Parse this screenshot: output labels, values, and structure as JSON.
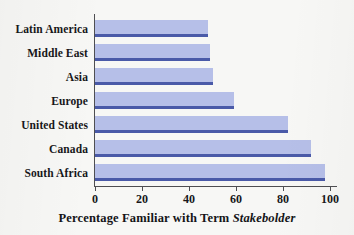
{
  "chart_data": {
    "type": "bar",
    "orientation": "horizontal",
    "title": "",
    "xlabel": "Percentage Familiar with Term Stakebolder",
    "xlabel_prefix": "Percentage Familiar with Term",
    "xlabel_emphasis": "Stakebolder",
    "ylabel": "",
    "categories": [
      "Latin America",
      "Middle East",
      "Asia",
      "Europe",
      "United States",
      "Canada",
      "South Africa"
    ],
    "values": [
      48,
      49,
      50,
      59,
      82,
      92,
      98
    ],
    "xlim": [
      0,
      100
    ],
    "xticks": [
      0,
      20,
      40,
      60,
      80,
      100
    ],
    "xtick_labels": [
      "0",
      "20",
      "40",
      "60",
      "80",
      "100"
    ],
    "grid": false,
    "legend": false,
    "bar_fill_color": "#b6bfe8",
    "bar_edge_color": "#4a5aa8",
    "axis_color": "#4e4e52",
    "background_color": "#f7f7f5"
  }
}
